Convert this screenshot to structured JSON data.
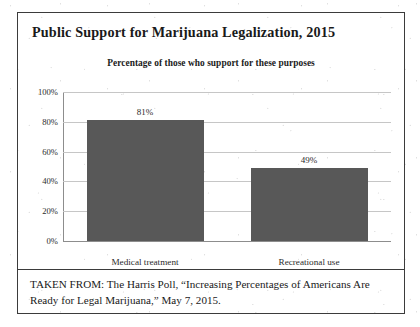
{
  "figure": {
    "title": "Public Support for Marijuana Legalization, 2015",
    "caption": "TAKEN FROM: The Harris Poll, “Increasing Percentages of Americans Are Ready for Legal Marijuana,” May 7, 2015."
  },
  "chart_data": {
    "type": "bar",
    "title": "Percentage of those who support for these purposes",
    "categories": [
      "Medical treatment",
      "Recreational use"
    ],
    "values": [
      81,
      49
    ],
    "data_labels": [
      "81%",
      "49%"
    ],
    "xlabel": "",
    "ylabel": "",
    "ylim": [
      0,
      100
    ],
    "yticks": [
      0,
      20,
      40,
      60,
      80,
      100
    ],
    "ytick_labels": [
      "0%",
      "20%",
      "40%",
      "60%",
      "80%",
      "100%"
    ],
    "grid": "horizontal",
    "legend": "none",
    "series_color": "#585858"
  }
}
